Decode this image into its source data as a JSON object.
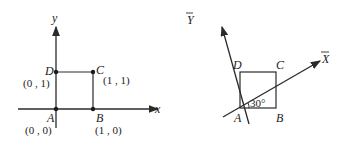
{
  "left_figure": {
    "axis_x_label": "x",
    "axis_y_label": "y",
    "points": [
      {
        "name": "A",
        "coord": "(0 , 0)"
      },
      {
        "name": "B",
        "coord": "(1 , 0)"
      },
      {
        "name": "C",
        "coord": "(1 , 1)"
      },
      {
        "name": "D",
        "coord": "(0 , 1)"
      }
    ]
  },
  "right_figure": {
    "axis_x_label": "X",
    "axis_y_label": "Y",
    "axis_bar": "—",
    "angle_label": "30°",
    "points": [
      {
        "name": "A"
      },
      {
        "name": "B"
      },
      {
        "name": "C"
      },
      {
        "name": "D"
      }
    ]
  },
  "colors": {
    "line": "#2a2a2a",
    "text": "#222222"
  }
}
